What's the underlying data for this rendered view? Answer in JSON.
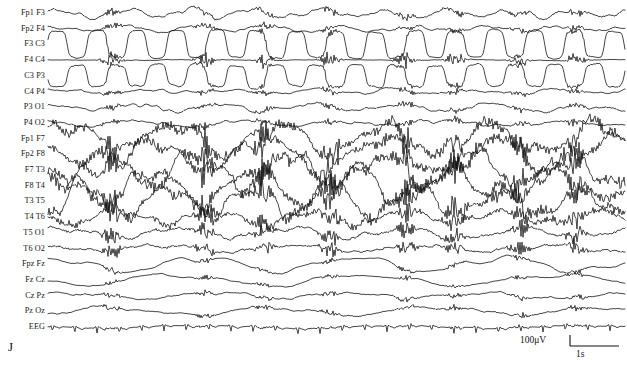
{
  "figure": {
    "panel_letter": "J",
    "width": 627,
    "height": 366,
    "background_color": "#ffffff",
    "trace_color": "#111111",
    "label_color": "#141414",
    "plot_left": 48,
    "plot_right": 625,
    "first_row_y": 13,
    "row_spacing": 15.7
  },
  "scale_bar": {
    "amplitude_label": "100μV",
    "time_label": "1s",
    "amplitude_value": 100,
    "amplitude_units": "μV",
    "time_value": 1,
    "time_units": "s",
    "vertical_tick_height": 11,
    "horizontal_length": 49
  },
  "chart_data": {
    "type": "line",
    "title": "",
    "subtitle": "",
    "xlabel": "",
    "ylabel": "",
    "legend_position": "left-labels",
    "grid": false,
    "recording_type": "multichannel EEG / polysomnography montage",
    "montage": "bipolar longitudinal + midline",
    "n_channels": 21,
    "x_axis": {
      "units": "seconds",
      "calibration_ref": "1s",
      "tick_labels": []
    },
    "y_axis": {
      "units": "microvolts",
      "calibration_ref": "100μV",
      "tick_labels": []
    },
    "channels": [
      {
        "label": "Fp1 F3",
        "row": 0,
        "baseline_amp": 2.2,
        "slow_amp": 3.4,
        "slow_freq": 0.9,
        "slow_phase": 0.2,
        "burst_amp": 3.0,
        "hf_amp": 0.7,
        "seed": 101
      },
      {
        "label": "Fp2 F4",
        "row": 1,
        "baseline_amp": 1.6,
        "slow_amp": 2.2,
        "slow_freq": 0.8,
        "slow_phase": 1.1,
        "burst_amp": 2.6,
        "hf_amp": 0.5,
        "seed": 202
      },
      {
        "label": "F3 C3",
        "row": 2,
        "baseline_amp": 1.2,
        "slow_amp": 13.5,
        "slow_freq": 1.45,
        "slow_phase": 0.0,
        "burst_amp": 2.0,
        "hf_amp": 0.5,
        "seed": 303,
        "square_wave": true
      },
      {
        "label": "F4 C4",
        "row": 3,
        "baseline_amp": 0.35,
        "slow_amp": 0.3,
        "slow_freq": 0.4,
        "slow_phase": 2.0,
        "burst_amp": 5.5,
        "hf_amp": 0.2,
        "seed": 404,
        "isoelectric": true
      },
      {
        "label": "C3 P3",
        "row": 4,
        "baseline_amp": 1.7,
        "slow_amp": 11.0,
        "slow_freq": 1.45,
        "slow_phase": 3.14,
        "burst_amp": 2.2,
        "hf_amp": 0.6,
        "seed": 505,
        "square_wave": true
      },
      {
        "label": "C4 P4",
        "row": 5,
        "baseline_amp": 1.5,
        "slow_amp": 1.4,
        "slow_freq": 0.7,
        "slow_phase": 0.6,
        "burst_amp": 2.4,
        "hf_amp": 0.5,
        "seed": 606
      },
      {
        "label": "P3 O1",
        "row": 6,
        "baseline_amp": 2.0,
        "slow_amp": 3.0,
        "slow_freq": 0.65,
        "slow_phase": 1.8,
        "burst_amp": 2.8,
        "hf_amp": 0.6,
        "seed": 707
      },
      {
        "label": "P4 O2",
        "row": 7,
        "baseline_amp": 1.8,
        "slow_amp": 2.4,
        "slow_freq": 0.55,
        "slow_phase": 2.6,
        "burst_amp": 2.6,
        "hf_amp": 0.6,
        "seed": 808
      },
      {
        "label": "Fp1 F7",
        "row": 8,
        "baseline_amp": 2.4,
        "slow_amp": 14.0,
        "slow_freq": 0.55,
        "slow_phase": 0.3,
        "burst_amp": 9.0,
        "hf_amp": 3.4,
        "seed": 909,
        "muscle": true
      },
      {
        "label": "Fp2 F8",
        "row": 9,
        "baseline_amp": 2.2,
        "slow_amp": 15.0,
        "slow_freq": 0.5,
        "slow_phase": 2.4,
        "burst_amp": 9.5,
        "hf_amp": 3.2,
        "seed": 1010,
        "muscle": true
      },
      {
        "label": "F7 T3",
        "row": 10,
        "baseline_amp": 2.6,
        "slow_amp": 16.0,
        "slow_freq": 0.62,
        "slow_phase": 4.1,
        "burst_amp": 10.0,
        "hf_amp": 3.8,
        "seed": 1111,
        "muscle": true
      },
      {
        "label": "F8 T4",
        "row": 11,
        "baseline_amp": 2.4,
        "slow_amp": 15.5,
        "slow_freq": 0.58,
        "slow_phase": 1.2,
        "burst_amp": 9.5,
        "hf_amp": 3.6,
        "seed": 1212,
        "muscle": true
      },
      {
        "label": "T3 T5",
        "row": 12,
        "baseline_amp": 2.5,
        "slow_amp": 13.0,
        "slow_freq": 0.7,
        "slow_phase": 5.0,
        "burst_amp": 9.0,
        "hf_amp": 3.4,
        "seed": 1313,
        "muscle": true
      },
      {
        "label": "T4 T6",
        "row": 13,
        "baseline_amp": 1.9,
        "slow_amp": 6.0,
        "slow_freq": 0.6,
        "slow_phase": 3.3,
        "burst_amp": 8.0,
        "hf_amp": 2.2,
        "seed": 1414,
        "muscle": true
      },
      {
        "label": "T5 O1",
        "row": 14,
        "baseline_amp": 1.9,
        "slow_amp": 4.5,
        "slow_freq": 0.5,
        "slow_phase": 0.9,
        "burst_amp": 6.5,
        "hf_amp": 1.3,
        "seed": 1515
      },
      {
        "label": "T6 O2",
        "row": 15,
        "baseline_amp": 1.7,
        "slow_amp": 3.2,
        "slow_freq": 0.45,
        "slow_phase": 2.2,
        "burst_amp": 5.5,
        "hf_amp": 1.0,
        "seed": 1616
      },
      {
        "label": "Fpz Fz",
        "row": 16,
        "baseline_amp": 1.0,
        "slow_amp": 6.5,
        "slow_freq": 0.38,
        "slow_phase": 1.5,
        "burst_amp": 2.0,
        "hf_amp": 0.3,
        "seed": 1717
      },
      {
        "label": "Fz Cz",
        "row": 17,
        "baseline_amp": 0.9,
        "slow_amp": 5.0,
        "slow_freq": 0.3,
        "slow_phase": 3.8,
        "burst_amp": 1.8,
        "hf_amp": 0.3,
        "seed": 1818
      },
      {
        "label": "Cz Pz",
        "row": 18,
        "baseline_amp": 1.4,
        "slow_amp": 2.6,
        "slow_freq": 0.42,
        "slow_phase": 0.4,
        "burst_amp": 2.2,
        "hf_amp": 0.5,
        "seed": 1919
      },
      {
        "label": "Pz Oz",
        "row": 19,
        "baseline_amp": 1.5,
        "slow_amp": 3.6,
        "slow_freq": 0.35,
        "slow_phase": 5.6,
        "burst_amp": 2.4,
        "hf_amp": 0.5,
        "seed": 2020
      },
      {
        "label": "EEG",
        "row": 20,
        "baseline_amp": 0.7,
        "slow_amp": 1.2,
        "slow_freq": 0.3,
        "slow_phase": 2.9,
        "burst_amp": 1.0,
        "hf_amp": 0.25,
        "seed": 2121,
        "ecg": true,
        "ecg_period_px": 22.3,
        "ecg_spike_amp": 5.2
      }
    ],
    "burst_events_x": [
      112,
      205,
      264,
      330,
      406,
      455,
      520,
      576
    ]
  }
}
